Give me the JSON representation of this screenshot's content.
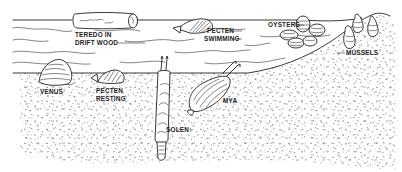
{
  "diagram": {
    "regions": {
      "water": "water",
      "sediment": "sand-mud-bottom",
      "shore": "rocky-shore-slope"
    },
    "labels": {
      "teredo_line1": "TEREDO IN",
      "teredo_line2": "DRIFT WOOD",
      "pecten_swimming_line1": "PECTEN",
      "pecten_swimming_line2": "SWIMMING",
      "oysters": "OYSTERS",
      "mussels": "MUSSELS",
      "venus": "VENUS",
      "pecten_resting_line1": "PECTEN",
      "pecten_resting_line2": "RESTING",
      "mya": "MYA",
      "solen": "SOLEN"
    },
    "colors": {
      "ink": "#222222",
      "background": "#ffffff"
    }
  }
}
